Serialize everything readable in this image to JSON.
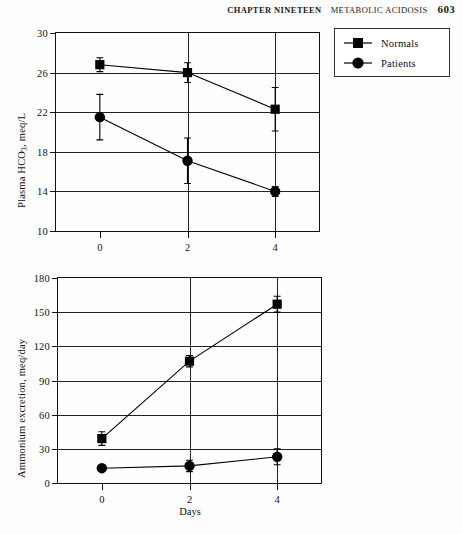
{
  "running_head": {
    "chapter": "CHAPTER NINETEEN",
    "section": "METABOLIC ACIDOSIS",
    "page_number": "603"
  },
  "legend": {
    "items": [
      {
        "label": "Normals",
        "marker": "square",
        "color": "#000000"
      },
      {
        "label": "Patients",
        "marker": "circle",
        "color": "#000000"
      }
    ]
  },
  "axis_x_label": "Days",
  "chart_data": [
    {
      "type": "line",
      "id": "plasma-bicarbonate",
      "title": "",
      "xlabel": "",
      "ylabel": "Plasma HCO3, meq/L",
      "ylabel_base": "Plasma HCO",
      "ylabel_sub": "3",
      "ylabel_tail": ", meq/L",
      "x": [
        0,
        2,
        4
      ],
      "xtick_labels": [
        "0",
        "2",
        "4"
      ],
      "xlim": [
        -1,
        5
      ],
      "ylim": [
        10,
        30
      ],
      "ytick_labels": [
        "10",
        "14",
        "18",
        "22",
        "26",
        "30"
      ],
      "yticks": [
        10,
        14,
        18,
        22,
        26,
        30
      ],
      "grid": true,
      "legend_position": "outside-top-right",
      "series": [
        {
          "name": "Normals",
          "marker": "square",
          "values": [
            26.8,
            26.0,
            22.3
          ],
          "error": [
            0.7,
            1.0,
            2.2
          ]
        },
        {
          "name": "Patients",
          "marker": "circle",
          "values": [
            21.5,
            17.1,
            14.0
          ],
          "error": [
            2.3,
            2.3,
            0.5
          ]
        }
      ]
    },
    {
      "type": "line",
      "id": "ammonium-excretion",
      "title": "",
      "xlabel": "Days",
      "ylabel": "Ammonium excretion, meq/day",
      "x": [
        0,
        2,
        4
      ],
      "xtick_labels": [
        "0",
        "2",
        "4"
      ],
      "xlim": [
        -1,
        5
      ],
      "ylim": [
        0,
        180
      ],
      "ytick_labels": [
        "0",
        "30",
        "60",
        "90",
        "120",
        "150",
        "180"
      ],
      "yticks": [
        0,
        30,
        60,
        90,
        120,
        150,
        180
      ],
      "grid": true,
      "series": [
        {
          "name": "Normals",
          "marker": "square",
          "values": [
            39,
            107,
            157
          ],
          "error": [
            6,
            5,
            7
          ]
        },
        {
          "name": "Patients",
          "marker": "circle",
          "values": [
            13,
            15,
            23
          ],
          "error": [
            2,
            5,
            7
          ]
        }
      ]
    }
  ]
}
